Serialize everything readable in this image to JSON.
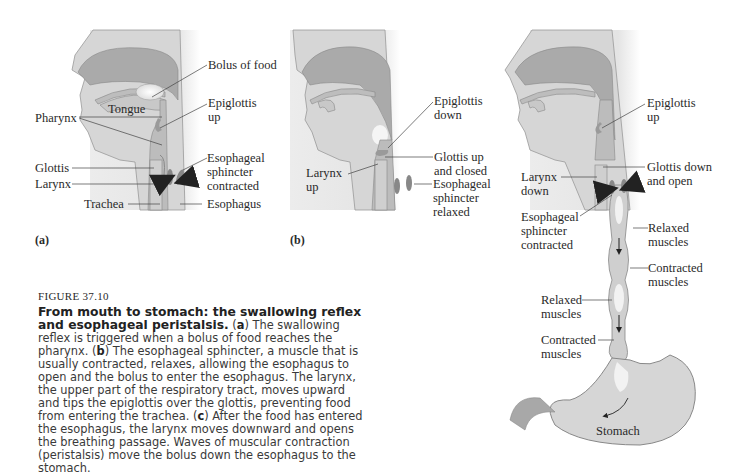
{
  "figure": {
    "number": "FIGURE 37.10",
    "title": "From mouth to stomach: the swallowing reflex and esophageal peristalsis.",
    "caption_parts": [
      {
        "letter": "a",
        "text": "The swallowing reflex is triggered when a bolus of food reaches the pharynx."
      },
      {
        "letter": "b",
        "text": "The esophageal sphincter, a muscle that is usually contracted, relaxes, allowing the esophagus to open and the bolus to enter the esophagus. The larynx, the upper part of the respiratory tract, moves upward and tips the epiglottis over the glottis, preventing food from entering the trachea."
      },
      {
        "letter": "c",
        "text": "After the food has entered the esophagus, the larynx moves downward and opens the breathing passage. Waves of muscular contraction (peristalsis) move the bolus down the esophagus to the stomach."
      }
    ]
  },
  "panels": {
    "a": {
      "letter": "(a)",
      "labels": {
        "bolus": "Bolus of food",
        "tongue": "Tongue",
        "pharynx": "Pharynx",
        "epiglottis_1": "Epiglottis",
        "epiglottis_2": "up",
        "glottis": "Glottis",
        "larynx": "Larynx",
        "trachea": "Trachea",
        "sphincter_1": "Esophageal",
        "sphincter_2": "sphincter",
        "sphincter_3": "contracted",
        "esophagus": "Esophagus"
      }
    },
    "b": {
      "letter": "(b)",
      "labels": {
        "epiglottis_1": "Epiglottis",
        "epiglottis_2": "down",
        "glottis_1": "Glottis up",
        "glottis_2": "and closed",
        "larynx_1": "Larynx",
        "larynx_2": "up",
        "sphincter_1": "Esophageal",
        "sphincter_2": "sphincter",
        "sphincter_3": "relaxed"
      }
    },
    "c": {
      "labels": {
        "epiglottis_1": "Epiglottis",
        "epiglottis_2": "up",
        "glottis_1": "Glottis down",
        "glottis_2": "and open",
        "larynx_1": "Larynx",
        "larynx_2": "down",
        "sphincter_1": "Esophageal",
        "sphincter_2": "sphincter",
        "sphincter_3": "contracted",
        "relaxed_r_1": "Relaxed",
        "relaxed_r_2": "muscles",
        "contracted_r_1": "Contracted",
        "contracted_r_2": "muscles",
        "relaxed_l_1": "Relaxed",
        "relaxed_l_2": "muscles",
        "contracted_l_1": "Contracted",
        "contracted_l_2": "muscles",
        "stomach": "Stomach"
      }
    }
  },
  "colors": {
    "tissue_dark": "#a9a9a9",
    "tissue_mid": "#c4c4c4",
    "tissue_light": "#dcdcdc",
    "background_shade": "#e8e8e8",
    "bolus": "#f2f2f2",
    "leader_line": "#444444"
  }
}
